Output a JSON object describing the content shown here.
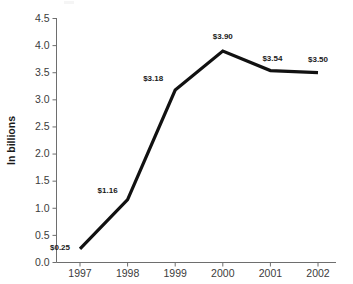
{
  "chart_data": {
    "type": "line",
    "title": "",
    "subtitle": "",
    "xlabel": "",
    "ylabel": "In billions",
    "categories": [
      "1997",
      "1998",
      "1999",
      "2000",
      "2001",
      "2002"
    ],
    "values": [
      0.25,
      1.16,
      3.18,
      3.9,
      3.54,
      3.5
    ],
    "point_labels": [
      "$0.25",
      "$1.16",
      "$3.18",
      "$3.90",
      "$3.54",
      "$3.50"
    ],
    "ylim": [
      0.0,
      4.5
    ],
    "ytick_labels": [
      "0.0",
      "0.5",
      "1.0",
      "1.5",
      "2.0",
      "2.5",
      "3.0",
      "3.5",
      "4.0",
      "4.5"
    ],
    "ytick_values": [
      0.0,
      0.5,
      1.0,
      1.5,
      2.0,
      2.5,
      3.0,
      3.5,
      4.0,
      4.5
    ],
    "grid": false,
    "legend": false,
    "legend_position": "none",
    "series": [
      {
        "name": "",
        "values": [
          0.25,
          1.16,
          3.18,
          3.9,
          3.54,
          3.5
        ],
        "color": "#111111"
      }
    ],
    "colors": {
      "line": "#111111",
      "axis": "#6e6e6e",
      "tick_text": "#3b3b3b",
      "label_text": "#1a1a1a",
      "background": "#ffffff"
    }
  }
}
